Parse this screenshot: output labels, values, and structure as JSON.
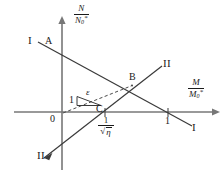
{
  "figure": {
    "type": "line-diagram",
    "background_color": "#ffffff",
    "line_color": "#3a3a3a",
    "text_color": "#1a1a1a"
  },
  "axes": {
    "y_axis": {
      "label_numerator": "N",
      "label_denominator_base": "N",
      "label_denominator_sub": "0",
      "label_denominator_sup": "*",
      "label_text": "N/N0*"
    },
    "x_axis": {
      "label_numerator": "M",
      "label_denominator_base": "M",
      "label_denominator_sub": "0",
      "label_denominator_sup": "*",
      "label_text": "M/M0*"
    },
    "origin_label": "0"
  },
  "ticks": {
    "x": [
      {
        "label_num": "1",
        "label_den_sign": "√",
        "label_den_var": "η",
        "value": "1/sqrt(eta)"
      },
      {
        "label": "1",
        "value": "1"
      }
    ]
  },
  "points": [
    {
      "name": "A",
      "label": "A"
    },
    {
      "name": "B",
      "label": "B"
    },
    {
      "name": "C",
      "label": "C"
    }
  ],
  "curves": [
    {
      "name": "line-I",
      "label_left": "I",
      "label_right": "I",
      "style": "solid"
    },
    {
      "name": "line-II",
      "label_upper": "II",
      "label_lower": "II",
      "style": "solid"
    },
    {
      "name": "dashed-slope-line",
      "style": "dashed"
    }
  ],
  "slope_triangle": {
    "vertical_label": "1",
    "slope_label": "ε"
  }
}
